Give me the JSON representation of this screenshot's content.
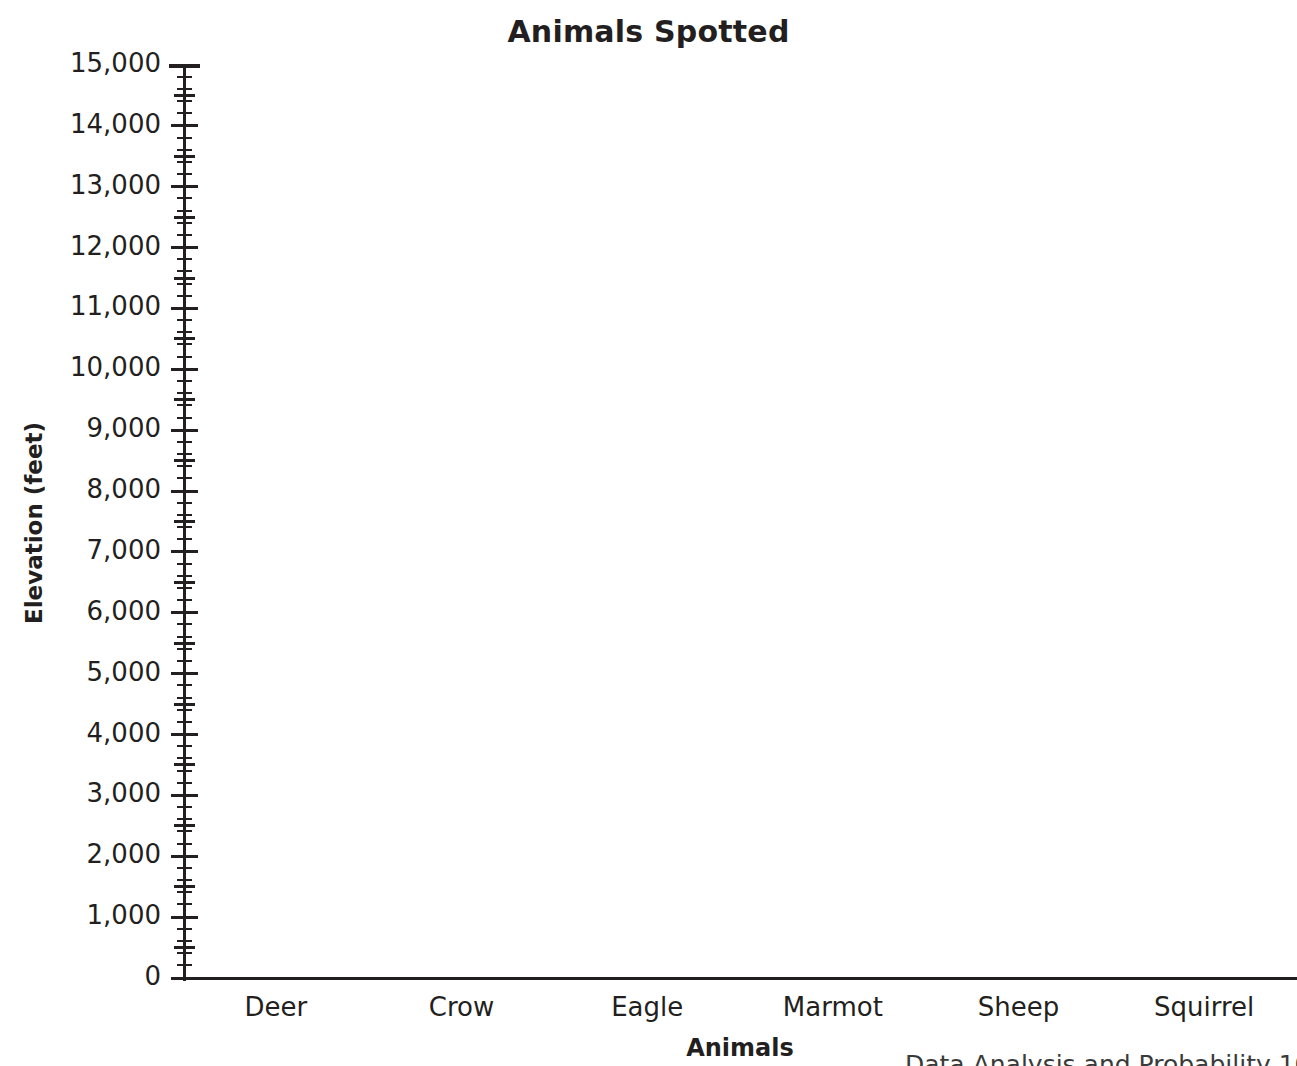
{
  "chart_data": {
    "type": "bar",
    "title": "Animals Spotted",
    "xlabel": "Animals",
    "ylabel": "Elevation (feet)",
    "categories": [
      "Deer",
      "Crow",
      "Eagle",
      "Marmot",
      "Sheep",
      "Squirrel"
    ],
    "values": [
      null,
      null,
      null,
      null,
      null,
      null
    ],
    "ylim": [
      0,
      15000
    ],
    "y_major_step": 1000,
    "y_minor_step": 200,
    "y_tick_labels": [
      "15,000",
      "14,000",
      "13,000",
      "12,000",
      "11,000",
      "10,000",
      "9,000",
      "8,000",
      "7,000",
      "6,000",
      "5,000",
      "4,000",
      "3,000",
      "2,000",
      "1,000",
      "0"
    ],
    "grid": false,
    "legend": null,
    "annotations": [],
    "note": "Blank plotting template - no data series drawn in the plot area"
  },
  "page": {
    "footer_text": "Data Analysis and Probability   107"
  },
  "style": {
    "ink_color": "#231f20",
    "background": "#ffffff"
  }
}
